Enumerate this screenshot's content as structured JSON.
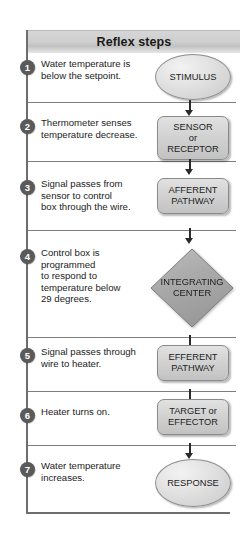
{
  "title": "Reflex steps",
  "colors": {
    "frame": "#6e6e6e",
    "badge": "#5a5a5a",
    "header_bar": "#cfcfcf",
    "shape_fill": "#d4d4d4",
    "diamond_fill": "#a8a8a8",
    "arrow": "#2a2a2a",
    "text": "#1c1c1c"
  },
  "steps": [
    {
      "number": "1",
      "lines": [
        "Water temperature is",
        "below the setpoint."
      ],
      "shape": {
        "type": "ellipse",
        "label_lines": [
          "STIMULUS"
        ]
      }
    },
    {
      "number": "2",
      "lines": [
        "Thermometer senses",
        "temperature decrease."
      ],
      "shape": {
        "type": "rounded-rect",
        "label_lines": [
          "SENSOR",
          "or",
          "RECEPTOR"
        ]
      }
    },
    {
      "number": "3",
      "lines": [
        "Signal passes from",
        "sensor to control",
        "box through the wire."
      ],
      "shape": {
        "type": "rounded-rect",
        "label_lines": [
          "AFFERENT",
          "PATHWAY"
        ]
      }
    },
    {
      "number": "4",
      "lines": [
        "Control box is",
        "programmed",
        "to respond to",
        "temperature below",
        "29 degrees."
      ],
      "shape": {
        "type": "diamond",
        "label_lines": [
          "INTEGRATING",
          "CENTER"
        ]
      }
    },
    {
      "number": "5",
      "lines": [
        "Signal passes through",
        "wire to heater."
      ],
      "shape": {
        "type": "rounded-rect",
        "label_lines": [
          "EFFERENT",
          "PATHWAY"
        ]
      }
    },
    {
      "number": "6",
      "lines": [
        "Heater turns on."
      ],
      "shape": {
        "type": "rounded-rect",
        "label_lines": [
          "TARGET or",
          "EFFECTOR"
        ]
      }
    },
    {
      "number": "7",
      "lines": [
        "Water temperature",
        "increases."
      ],
      "shape": {
        "type": "ellipse",
        "label_lines": [
          "RESPONSE"
        ]
      }
    }
  ]
}
